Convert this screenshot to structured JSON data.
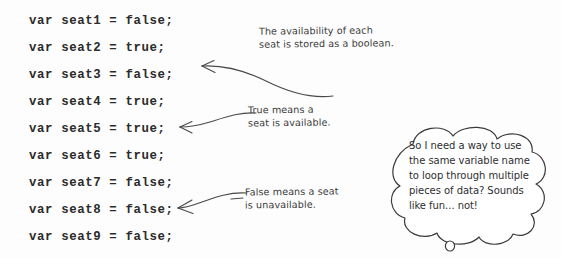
{
  "page": {
    "background_color": "#fdfdfd",
    "ink_color": "#2b2b2b",
    "handwriting_color": "#39393a"
  },
  "code": {
    "language": "javascript",
    "lines": [
      "var seat1 = false;",
      "var seat2 = true;",
      "var seat3 = false;",
      "var seat4 = true;",
      "var seat5 = true;",
      "var seat6 = true;",
      "var seat7 = false;",
      "var seat8 = false;",
      "var seat9 = false;"
    ]
  },
  "annotations": [
    {
      "id": "availability-note",
      "text": "The availability of each\nseat is stored as a boolean.",
      "points_to_line": 3
    },
    {
      "id": "true-note",
      "text": "True means a\nseat is available.",
      "points_to_line": 5
    },
    {
      "id": "false-note",
      "text": "False means a seat\nis unavailable.",
      "points_to_line": 8
    }
  ],
  "thought_bubble": {
    "text": "So I need a way to use the same variable name to loop through multiple pieces of data? Sounds like fun... not!"
  }
}
